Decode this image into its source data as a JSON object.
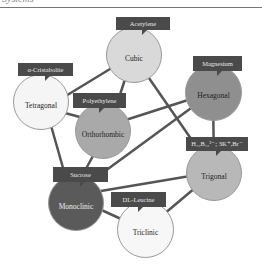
{
  "header": {
    "title": "Systems"
  },
  "colors": {
    "callout_bg": "#4a4a4a",
    "edge": "#555555"
  },
  "nodes": [
    {
      "id": "cubic",
      "label": "Cubic",
      "example": "Acetylene",
      "color": "#d9d9d9"
    },
    {
      "id": "tetragonal",
      "label": "Tetragonal",
      "example": "α-Cristabolite",
      "color": "#f5f5f5"
    },
    {
      "id": "hexagonal",
      "label": "Hexagonal",
      "example": "Magnesium",
      "color": "#8f8f8f"
    },
    {
      "id": "orthorhombic",
      "label": "Orthorhombic",
      "example": "Polyethylene",
      "color": "#a9a9a9"
    },
    {
      "id": "trigonal",
      "label": "Trigonal",
      "example": "H₁₂B₁₂²⁻; 3K⁺,Br⁻",
      "color": "#b8b8b8"
    },
    {
      "id": "monoclinic",
      "label": "Monoclinic",
      "example": "Sucrose",
      "color": "#5a5a5a"
    },
    {
      "id": "triclinic",
      "label": "Triclinic",
      "example": "DL-Leucine",
      "color": "#f7f7f7"
    }
  ],
  "edges": [
    [
      "cubic",
      "tetragonal"
    ],
    [
      "cubic",
      "orthorhombic"
    ],
    [
      "cubic",
      "trigonal"
    ],
    [
      "tetragonal",
      "orthorhombic"
    ],
    [
      "tetragonal",
      "monoclinic"
    ],
    [
      "orthorhombic",
      "hexagonal"
    ],
    [
      "orthorhombic",
      "monoclinic"
    ],
    [
      "hexagonal",
      "monoclinic"
    ],
    [
      "hexagonal",
      "trigonal"
    ],
    [
      "monoclinic",
      "trigonal"
    ],
    [
      "monoclinic",
      "triclinic"
    ],
    [
      "triclinic",
      "trigonal"
    ]
  ]
}
